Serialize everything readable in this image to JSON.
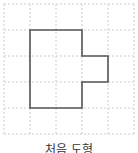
{
  "grid": {
    "cols": 5,
    "rows": 5,
    "cell_size": 26,
    "origin_x": 4,
    "origin_y": 4,
    "line_color": "#cccccc"
  },
  "shape": {
    "name": "polygon",
    "stroke_color": "#555555",
    "points_grid": [
      [
        1,
        1
      ],
      [
        3,
        1
      ],
      [
        3,
        2
      ],
      [
        4,
        2
      ],
      [
        4,
        3
      ],
      [
        3,
        3
      ],
      [
        3,
        4
      ],
      [
        1,
        4
      ]
    ]
  },
  "caption": "처음 도형"
}
